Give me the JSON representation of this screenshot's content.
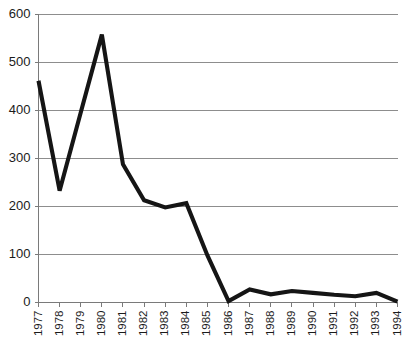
{
  "chart_data": {
    "type": "line",
    "title": "",
    "subtitle": "",
    "xlabel": "",
    "ylabel": "",
    "categories": [
      "1977",
      "1978",
      "1979",
      "1980",
      "1981",
      "1982",
      "1983",
      "1984",
      "1985",
      "1986",
      "1987",
      "1988",
      "1989",
      "1990",
      "1991",
      "1992",
      "1993",
      "1994"
    ],
    "values": [
      462,
      233,
      396,
      558,
      288,
      213,
      198,
      207,
      98,
      3,
      27,
      17,
      24,
      20,
      16,
      13,
      20,
      2
    ],
    "series": [
      {
        "name": "series-1",
        "values": [
          462,
          233,
          396,
          558,
          288,
          213,
          198,
          207,
          98,
          3,
          27,
          17,
          24,
          20,
          16,
          13,
          20,
          2
        ]
      }
    ],
    "ylim": [
      0,
      600
    ],
    "ytick_labels": [
      "0",
      "100",
      "200",
      "300",
      "400",
      "500",
      "600"
    ],
    "ytick_values": [
      0,
      100,
      200,
      300,
      400,
      500,
      600
    ],
    "xtick_labels": [
      "1977",
      "1978",
      "1979",
      "1980",
      "1981",
      "1982",
      "1983",
      "1984",
      "1985",
      "1986",
      "1987",
      "1988",
      "1989",
      "1990",
      "1991",
      "1992",
      "1993",
      "1994"
    ],
    "grid": true,
    "grid_axis": "y",
    "legend": false,
    "legend_position": "none",
    "line_color": "#151515",
    "grid_color": "#8d8d8d",
    "axis_color": "#7a7a7a",
    "background_color": "#ffffff",
    "xtick_rotation": 90
  }
}
